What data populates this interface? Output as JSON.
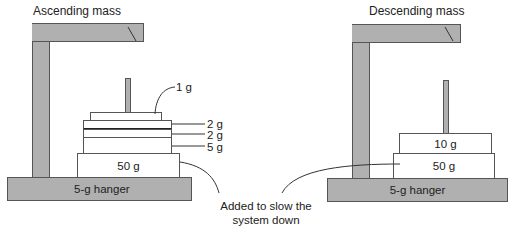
{
  "left": {
    "title": "Ascending mass",
    "hanger_label": "5-g hanger",
    "base_mass_label": "50 g",
    "stack_labels": [
      "1 g",
      "2 g",
      "2 g",
      "5 g"
    ]
  },
  "right": {
    "title": "Descending mass",
    "hanger_label": "5-g hanger",
    "masses": [
      "10 g",
      "50 g"
    ]
  },
  "annotation": {
    "line1": "Added to slow the",
    "line2": "system down"
  }
}
